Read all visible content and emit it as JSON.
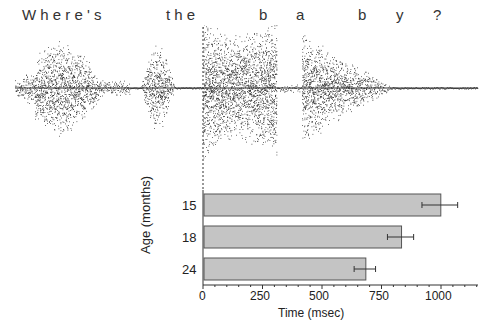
{
  "sentence": {
    "words": [
      {
        "text": "W h e r e ' s",
        "x": 22
      },
      {
        "text": "t h e",
        "x": 166
      },
      {
        "text": "b",
        "x": 259
      },
      {
        "text": "a",
        "x": 296
      },
      {
        "text": "b",
        "x": 358
      },
      {
        "text": "y",
        "x": 396
      },
      {
        "text": "?",
        "x": 433
      }
    ]
  },
  "chart_data": {
    "type": "bar",
    "orientation": "horizontal",
    "categories": [
      "15",
      "18",
      "24"
    ],
    "values": [
      995,
      830,
      680
    ],
    "error": [
      75,
      55,
      45
    ],
    "xlabel": "Time (msec)",
    "ylabel": "Age (months)",
    "xlim": [
      0,
      1150
    ],
    "xticks": [
      0,
      250,
      500,
      750,
      1000
    ],
    "bar_color": "#c4c4c4",
    "grid": false,
    "annotation": "Dashed vertical line marks word onset of 'baby' (t=0) over speech waveform"
  },
  "axis": {
    "ylabel": "Age (months)",
    "xlabel": "Time (msec)",
    "ticks": [
      "0",
      "250",
      "500",
      "750",
      "1000"
    ],
    "cats": [
      "15",
      "18",
      "24"
    ]
  }
}
